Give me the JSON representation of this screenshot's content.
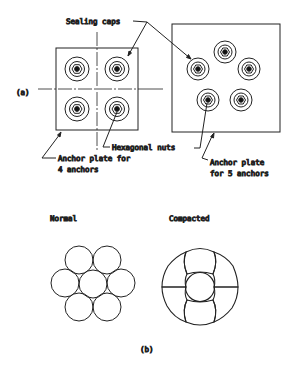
{
  "figure": {
    "part_a": {
      "label": "(a)",
      "callouts": {
        "sealing_caps": "Sealing caps",
        "hexagonal_nuts": "Hexagonal nuts",
        "plate4_line1": "Anchor plate for",
        "plate4_line2": "4 anchors",
        "plate5_line1": "Anchor plate",
        "plate5_line2": "for 5 anchors"
      },
      "plate_4": {
        "anchor_count": 4
      },
      "plate_5": {
        "anchor_count": 5
      }
    },
    "part_b": {
      "label": "(b)",
      "normal_label": "Normal",
      "compacted_label": "Compacted",
      "strand_wire_count": 7
    }
  }
}
